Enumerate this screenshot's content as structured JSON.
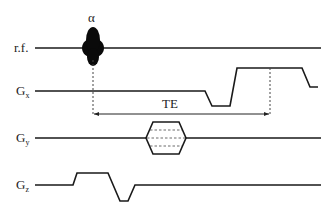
{
  "diagram": {
    "flip_angle_label": "α",
    "echo_time_label": "TE",
    "channels": [
      {
        "id": "rf",
        "label": "r.f.",
        "subscript": ""
      },
      {
        "id": "gx",
        "label": "G",
        "subscript": "x"
      },
      {
        "id": "gy",
        "label": "G",
        "subscript": "y"
      },
      {
        "id": "gz",
        "label": "G",
        "subscript": "z"
      }
    ],
    "colors": {
      "line": "#1a1a1a",
      "background": "#ffffff"
    }
  }
}
